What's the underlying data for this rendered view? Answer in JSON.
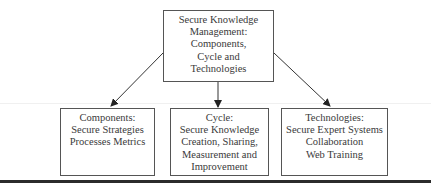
{
  "diagram": {
    "root": {
      "lines": [
        "Secure Knowledge",
        "Management:",
        "Components,",
        "Cycle and",
        "Technologies"
      ]
    },
    "children": [
      {
        "lines": [
          "Components:",
          "Secure Strategies",
          "Processes Metrics"
        ]
      },
      {
        "lines": [
          "Cycle:",
          "Secure Knowledge",
          "Creation, Sharing,",
          "Measurement and",
          "Improvement"
        ]
      },
      {
        "lines": [
          "Technologies:",
          "Secure Expert Systems",
          "Collaboration",
          "Web Training"
        ]
      }
    ],
    "edges": [
      {
        "from": "root",
        "to": "children.0"
      },
      {
        "from": "root",
        "to": "children.1"
      },
      {
        "from": "root",
        "to": "children.2"
      }
    ]
  }
}
